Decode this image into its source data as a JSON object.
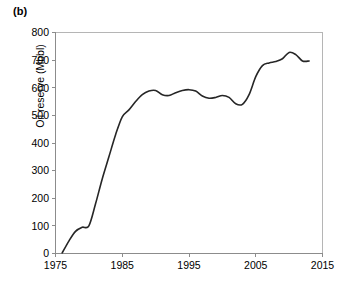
{
  "figure": {
    "panel_label": "(b)"
  },
  "chart_data": {
    "type": "line",
    "title": "",
    "subtitle": "",
    "xlabel": "",
    "ylabel": "Oil reserve (Mbbl)",
    "xlim": [
      1975,
      2015
    ],
    "ylim": [
      0,
      800
    ],
    "xticks": [
      1975,
      1985,
      1995,
      2005,
      2015
    ],
    "yticks": [
      0,
      100,
      200,
      300,
      400,
      500,
      600,
      700,
      800
    ],
    "xtick_labels": [
      "1975",
      "1985",
      "1995",
      "2005",
      "2015"
    ],
    "ytick_labels": [
      "0",
      "100",
      "200",
      "300",
      "400",
      "500",
      "600",
      "700",
      "800"
    ],
    "grid": false,
    "legend": null,
    "legend_position": "none",
    "series": [
      {
        "name": "Oil reserve",
        "color": "#262626",
        "x": [
          1976,
          1977,
          1978,
          1979,
          1980,
          1981,
          1982,
          1983,
          1984,
          1985,
          1986,
          1987,
          1988,
          1989,
          1990,
          1991,
          1992,
          1993,
          1994,
          1995,
          1996,
          1997,
          1998,
          1999,
          2000,
          2001,
          2002,
          2003,
          2004,
          2005,
          2006,
          2007,
          2008,
          2009,
          2010,
          2011,
          2012,
          2013
        ],
        "values": [
          2,
          45,
          80,
          95,
          100,
          180,
          270,
          350,
          430,
          495,
          520,
          550,
          575,
          588,
          590,
          575,
          572,
          582,
          590,
          593,
          588,
          570,
          562,
          565,
          572,
          565,
          542,
          540,
          575,
          640,
          680,
          690,
          695,
          705,
          728,
          720,
          697,
          697
        ]
      }
    ],
    "annotations": []
  },
  "axis_style": {
    "axis_color": "#8c8c8c",
    "frame_color": "#b5b5b5",
    "line_color": "#262626",
    "background": "#ffffff"
  }
}
